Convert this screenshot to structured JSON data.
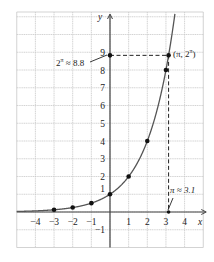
{
  "chart_data": {
    "type": "line",
    "title": "",
    "function": "y = 2^x",
    "xlabel": "x",
    "ylabel": "y",
    "xlim": [
      -5,
      5
    ],
    "ylim": [
      -2,
      11
    ],
    "grid": true,
    "x_ticks": [
      "−4",
      "−3",
      "−2",
      "−1",
      "1",
      "2",
      "3",
      "4"
    ],
    "x_tick_values": [
      -4,
      -3,
      -2,
      -1,
      1,
      2,
      3,
      4
    ],
    "y_ticks": [
      "−1",
      "1",
      "2",
      "3",
      "4",
      "5",
      "6",
      "7",
      "8",
      "9"
    ],
    "y_tick_values": [
      -1,
      1,
      2,
      3,
      4,
      5,
      6,
      7,
      8,
      9
    ],
    "points": [
      {
        "x": -3,
        "y": 0.125
      },
      {
        "x": -2,
        "y": 0.25
      },
      {
        "x": -1,
        "y": 0.5
      },
      {
        "x": 0,
        "y": 1
      },
      {
        "x": 1,
        "y": 2
      },
      {
        "x": 2,
        "y": 4
      },
      {
        "x": 3,
        "y": 8
      },
      {
        "x": 3.14159,
        "y": 8.825
      }
    ],
    "annotations": [
      {
        "text": "(π, 2^π)",
        "x": 3.14159,
        "y": 8.825
      },
      {
        "text": "2^π ≈ 8.8",
        "target": {
          "x": 0,
          "y": 8.825
        }
      },
      {
        "text": "π ≈ 3.1",
        "target": {
          "x": 3.14159,
          "y": 0
        }
      }
    ],
    "colors": {
      "curve": "#555555",
      "grid": "#c8c8c8",
      "axis": "#444444",
      "point": "#111111"
    }
  },
  "labels": {
    "x_axis": "x",
    "y_axis": "y",
    "point_label_base": "(π, 2",
    "point_label_exp": "π",
    "point_label_close": ")",
    "y_ann_base": "2",
    "y_ann_exp": "π",
    "y_ann_rest": " ≈ 8.8",
    "x_ann": "π ≈ 3.1"
  }
}
